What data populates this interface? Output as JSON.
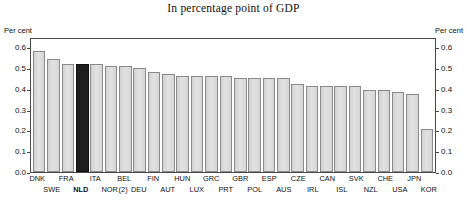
{
  "chart_title": "In percentage point of GDP",
  "axis": {
    "left_unit": "Per cent",
    "right_unit": "Per cent",
    "ticks": [
      "0.0",
      "0.1",
      "0.2",
      "0.3",
      "0.4",
      "0.5",
      "0.6"
    ]
  },
  "chart_data": {
    "type": "bar",
    "title": "In percentage point of GDP",
    "xlabel": "",
    "ylabel": "Per cent",
    "ylim": [
      0,
      0.65
    ],
    "grid": false,
    "legend": "none",
    "highlight_category": "NLD",
    "highlight_color": "#1e1e1e",
    "bar_color": "#dcdcdc",
    "footnote_marker": "(2)",
    "footnote_marker_category": "NOR",
    "categories": [
      "DNK",
      "SWE",
      "FRA",
      "NLD",
      "ITA",
      "NOR",
      "BEL",
      "DEU",
      "FIN",
      "AUT",
      "HUN",
      "LUX",
      "GRC",
      "PRT",
      "GBR",
      "POL",
      "ESP",
      "AUS",
      "CZE",
      "IRL",
      "CAN",
      "ISL",
      "SVK",
      "NZL",
      "CHE",
      "USA",
      "JPN",
      "KOR"
    ],
    "values": [
      0.59,
      0.55,
      0.53,
      0.53,
      0.53,
      0.52,
      0.52,
      0.51,
      0.49,
      0.48,
      0.47,
      0.47,
      0.47,
      0.47,
      0.46,
      0.46,
      0.46,
      0.46,
      0.43,
      0.42,
      0.42,
      0.42,
      0.42,
      0.4,
      0.4,
      0.39,
      0.38,
      0.21
    ],
    "tick_labels": [
      "0.0",
      "0.1",
      "0.2",
      "0.3",
      "0.4",
      "0.5",
      "0.6"
    ],
    "tick_values": [
      0.0,
      0.1,
      0.2,
      0.3,
      0.4,
      0.5,
      0.6
    ]
  },
  "x_labels_top": [
    "DNK",
    "FRA",
    "ITA",
    "BEL",
    "FIN",
    "HUN",
    "GRC",
    "GBR",
    "ESP",
    "CZE",
    "CAN",
    "SVK",
    "CHE",
    "JPN"
  ],
  "x_labels_bottom": [
    "SWE",
    "NLD",
    "NOR",
    "(2)",
    "DEU",
    "AUT",
    "LUX",
    "PRT",
    "POL",
    "AUS",
    "IRL",
    "ISL",
    "NZL",
    "USA",
    "KOR"
  ]
}
